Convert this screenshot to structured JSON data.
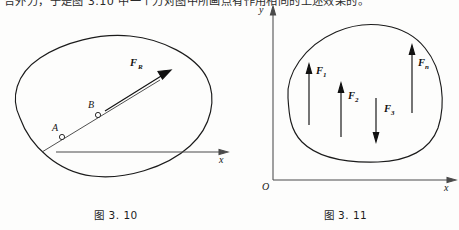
{
  "page": {
    "background_color": "#fdfdfc",
    "ink_color": "#1b1b1b",
    "clipped_body_text": "合外力，于是图 3.10 中一个力对图中所画点有作用相同的上述效果的。"
  },
  "figures": [
    {
      "id": "fig-3-10",
      "caption": "图 3. 10",
      "description": "Irregular closed body with line of action through points A and B carrying resultant force vector F_R, drawn above an x axis.",
      "axes": [
        {
          "name": "x",
          "label": "x",
          "orientation": "horizontal",
          "arrow": "right"
        }
      ],
      "points": [
        {
          "label": "A",
          "marker": "open-circle"
        },
        {
          "label": "B",
          "marker": "open-circle"
        }
      ],
      "vectors": [
        {
          "label": "F",
          "subscript": "R",
          "label_full": "F_R",
          "direction": "up-right",
          "style": "bold-italic"
        }
      ],
      "line_of_action": "diagonal line through A and B extended beyond the body"
    },
    {
      "id": "fig-3-11",
      "caption": "图 3. 11",
      "description": "Irregular closed body in the first quadrant of an x-y frame with four force vectors applied.",
      "axes": [
        {
          "name": "y",
          "label": "y",
          "orientation": "vertical",
          "arrow": "up"
        },
        {
          "name": "x",
          "label": "x",
          "orientation": "horizontal",
          "arrow": "right"
        }
      ],
      "origin_label": "O",
      "vectors": [
        {
          "label": "F",
          "subscript": "1",
          "label_full": "F_1",
          "direction": "up",
          "style": "bold-italic"
        },
        {
          "label": "F",
          "subscript": "2",
          "label_full": "F_2",
          "direction": "up",
          "style": "bold-italic"
        },
        {
          "label": "F",
          "subscript": "3",
          "label_full": "F_3",
          "direction": "down",
          "style": "bold-italic"
        },
        {
          "label": "F",
          "subscript": "n",
          "label_full": "F_n",
          "direction": "up",
          "style": "bold-italic"
        }
      ]
    }
  ]
}
